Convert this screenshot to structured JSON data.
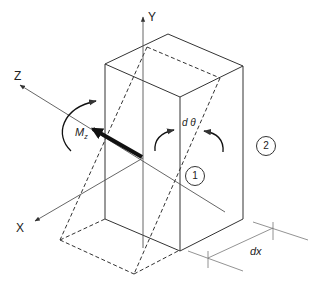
{
  "figure": {
    "axes": {
      "x_label": "X",
      "y_label": "Y",
      "z_label": "Z"
    },
    "labels": {
      "moment": "M",
      "moment_subscript": "z",
      "rotation_angle": "d θ",
      "element_length": "dx"
    },
    "sections": [
      {
        "id": "section-1",
        "label": "1"
      },
      {
        "id": "section-2",
        "label": "2"
      }
    ],
    "caption_visible": false,
    "colors": {
      "line": "#333333",
      "axis": "#555555",
      "background": "#ffffff"
    }
  }
}
